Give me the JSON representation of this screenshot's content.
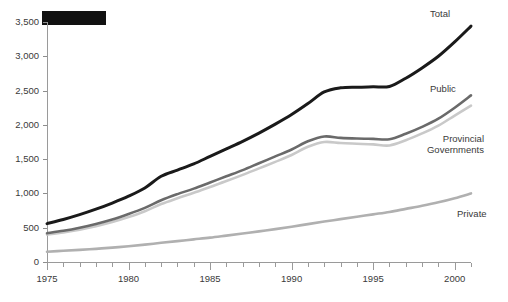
{
  "chart_data": {
    "type": "line",
    "title": "",
    "xlabel": "",
    "ylabel": "",
    "xlim": [
      1975,
      2001
    ],
    "ylim": [
      0,
      3500
    ],
    "grid": false,
    "legend_position": "right-end-labels",
    "x": [
      1975,
      1976,
      1977,
      1978,
      1979,
      1980,
      1981,
      1982,
      1983,
      1984,
      1985,
      1986,
      1987,
      1988,
      1989,
      1990,
      1991,
      1992,
      1993,
      1994,
      1995,
      1996,
      1997,
      1998,
      1999,
      2000,
      2001
    ],
    "y_tick_labels": [
      "0",
      "500",
      "1,000",
      "1,500",
      "2,000",
      "2,500",
      "3,000",
      "3,500"
    ],
    "y_tick_values": [
      0,
      500,
      1000,
      1500,
      2000,
      2500,
      3000,
      3500
    ],
    "x_tick_labels": [
      "1975",
      "1980",
      "1985",
      "1990",
      "1995",
      "2000"
    ],
    "x_tick_values": [
      1975,
      1980,
      1985,
      1990,
      1995,
      2000
    ],
    "series": [
      {
        "name": "Total",
        "color": "#1a1a1a",
        "width": 3.0,
        "values": [
          560,
          620,
          690,
          770,
          860,
          960,
          1080,
          1250,
          1340,
          1430,
          1540,
          1650,
          1760,
          1880,
          2010,
          2150,
          2310,
          2480,
          2540,
          2550,
          2555,
          2560,
          2680,
          2830,
          3000,
          3210,
          3440
        ]
      },
      {
        "name": "Public",
        "color": "#6a6a6a",
        "width": 2.6,
        "values": [
          420,
          455,
          500,
          555,
          620,
          700,
          790,
          900,
          990,
          1070,
          1160,
          1250,
          1340,
          1440,
          1540,
          1640,
          1760,
          1830,
          1810,
          1800,
          1795,
          1790,
          1870,
          1970,
          2090,
          2250,
          2430
        ]
      },
      {
        "name": "Provincial Governments",
        "color": "#c9c9c9",
        "width": 2.6,
        "values": [
          400,
          432,
          472,
          522,
          582,
          655,
          740,
          845,
          930,
          1010,
          1095,
          1180,
          1270,
          1365,
          1460,
          1560,
          1680,
          1750,
          1735,
          1725,
          1715,
          1700,
          1775,
          1875,
          1990,
          2135,
          2280
        ]
      },
      {
        "name": "Private",
        "color": "#b0b0b0",
        "width": 2.6,
        "values": [
          150,
          163,
          177,
          192,
          210,
          230,
          253,
          280,
          305,
          330,
          355,
          385,
          415,
          447,
          480,
          515,
          552,
          590,
          625,
          660,
          695,
          730,
          775,
          820,
          870,
          930,
          1000
        ]
      }
    ],
    "annotations": [
      {
        "name": "redacted-block",
        "type": "solid-rect",
        "color": "#111111"
      }
    ]
  },
  "series_labels": {
    "total": "Total",
    "public": "Public",
    "provincial_line1": "Provincial",
    "provincial_line2": "Governments",
    "private": "Private"
  }
}
